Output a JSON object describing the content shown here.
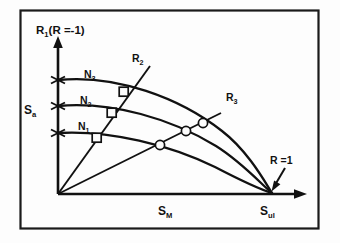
{
  "figure": {
    "kind": "haigh-constant-life-diagram",
    "background_color": "#fdfdfd",
    "border_color": "#1a1a1a",
    "line_color": "#111111"
  },
  "axes": {
    "y_label": {
      "main": "R",
      "sub": "1",
      "paren": "(R =-1)"
    },
    "y_label_full": "R1(R =-1)",
    "y_amplitude_label": {
      "main": "S",
      "sub": "a"
    },
    "y_amplitude_label_full": "Sa",
    "x_label": {
      "main": "S",
      "sub": "M"
    },
    "x_label_full": "SM",
    "x_end_label": {
      "main": "S",
      "sub": "ul"
    },
    "x_end_label_full": "Sul",
    "origin": {
      "x": 58,
      "y": 194
    },
    "y_axis_top": {
      "x": 58,
      "y": 38
    },
    "x_axis_right": {
      "x": 306,
      "y": 194
    },
    "y_ticks": [
      {
        "name": "tick-n1",
        "y": 133
      },
      {
        "name": "tick-n2",
        "y": 106
      },
      {
        "name": "tick-n3",
        "y": 80
      }
    ]
  },
  "annotations": {
    "r_equals_one": "R =1",
    "r_equals_one_arrow_from": {
      "x": 283,
      "y": 172
    },
    "r_equals_one_arrow_to": {
      "x": 272,
      "y": 190
    }
  },
  "curves": [
    {
      "name": "N1",
      "label": {
        "main": "N",
        "sub": "1"
      },
      "label_full": "N1",
      "label_pos": {
        "x": 84,
        "y": 127
      },
      "start": {
        "x": 58,
        "y": 133
      },
      "end": {
        "x": 272,
        "y": 193
      },
      "path": "M 58 133 C 110 130, 170 145, 215 167 C 240 180, 262 190, 272 193"
    },
    {
      "name": "N2",
      "label": {
        "main": "N",
        "sub": "2"
      },
      "label_full": "N2",
      "label_pos": {
        "x": 86,
        "y": 101
      },
      "start": {
        "x": 58,
        "y": 106
      },
      "end": {
        "x": 272,
        "y": 193
      },
      "path": "M 58 106 C 112 101, 172 119, 216 146 C 243 163, 263 186, 272 193"
    },
    {
      "name": "N3",
      "label": {
        "main": "N",
        "sub": "3"
      },
      "label_full": "N3",
      "label_pos": {
        "x": 91,
        "y": 75
      },
      "start": {
        "x": 58,
        "y": 80
      },
      "end": {
        "x": 272,
        "y": 193
      },
      "path": "M 58 80 C 116 74, 180 98, 222 131 C 248 151, 265 182, 272 193"
    }
  ],
  "radial_lines": [
    {
      "name": "R2",
      "label": {
        "main": "R",
        "sub": "2"
      },
      "label_full": "R2",
      "label_pos": {
        "x": 135,
        "y": 58
      },
      "from": {
        "x": 58,
        "y": 194
      },
      "to": {
        "x": 150,
        "y": 66
      },
      "marker_shape": "square",
      "markers": [
        {
          "x": 97,
          "y": 138
        },
        {
          "x": 112,
          "y": 113
        },
        {
          "x": 124,
          "y": 92
        }
      ]
    },
    {
      "name": "R3",
      "label": {
        "main": "R",
        "sub": "3"
      },
      "label_full": "R3",
      "label_pos": {
        "x": 230,
        "y": 98
      },
      "from": {
        "x": 58,
        "y": 194
      },
      "to": {
        "x": 221,
        "y": 113
      },
      "marker_shape": "circle",
      "markers": [
        {
          "x": 160,
          "y": 145
        },
        {
          "x": 186,
          "y": 131
        },
        {
          "x": 203,
          "y": 123
        }
      ]
    }
  ]
}
